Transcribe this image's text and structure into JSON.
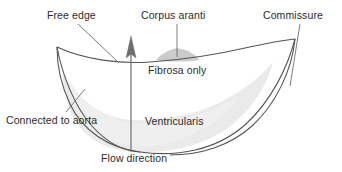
{
  "figure": {
    "background_color": "#ffffff",
    "stroke_color": "#4a4a4a",
    "text_color": "#2b2b2b",
    "ventricularis_fill": "#e8e8e8",
    "corpus_aranti_fill": "#c9c9c9",
    "arrow_color": "#6b6b6b"
  },
  "labels": {
    "free_edge": "Free edge",
    "corpus_aranti": "Corpus aranti",
    "commissure": "Commissure",
    "fibrosa_only": "Fibrosa only",
    "ventricularis": "Ventricularis",
    "connected_to_aorta": "Connected to aorta",
    "flow_direction": "Flow direction"
  }
}
